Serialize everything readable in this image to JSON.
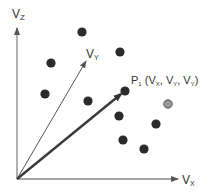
{
  "diagram": {
    "axes": {
      "z": {
        "label_main": "V",
        "label_sub": "Z"
      },
      "y": {
        "label_main": "V",
        "label_sub": "Y"
      },
      "x": {
        "label_main": "V",
        "label_sub": "X"
      }
    },
    "point_label": {
      "name_main": "P",
      "name_sub": "1",
      "open": " (V",
      "sub1": "X",
      "sep1": ", V",
      "sub2": "Y",
      "sep2": ", V",
      "sub3": "Y",
      "close": ")"
    },
    "colors": {
      "axis": "#777777",
      "dot": "#2b2b2b",
      "highlight_dot": "#9a9a9a",
      "vector": "#3a3a3a"
    },
    "points": [
      {
        "x": 82,
        "y": 32,
        "type": "dark"
      },
      {
        "x": 51,
        "y": 63,
        "type": "dark"
      },
      {
        "x": 120,
        "y": 52,
        "type": "dark"
      },
      {
        "x": 45,
        "y": 94,
        "type": "dark"
      },
      {
        "x": 88,
        "y": 101,
        "type": "dark"
      },
      {
        "x": 125,
        "y": 91,
        "type": "dark",
        "label": "P1"
      },
      {
        "x": 168,
        "y": 104,
        "type": "highlight"
      },
      {
        "x": 119,
        "y": 116,
        "type": "dark"
      },
      {
        "x": 156,
        "y": 124,
        "type": "dark"
      },
      {
        "x": 123,
        "y": 140,
        "type": "dark"
      },
      {
        "x": 144,
        "y": 149,
        "type": "dark"
      }
    ]
  }
}
